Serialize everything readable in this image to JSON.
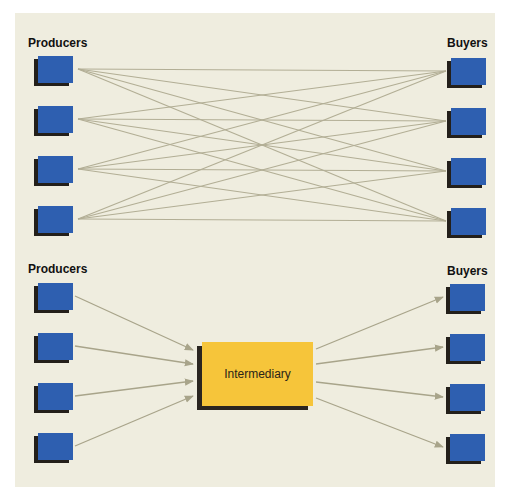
{
  "diagram": {
    "top": {
      "left_label": "Producers",
      "right_label": "Buyers",
      "producer_count": 4,
      "buyer_count": 4,
      "connection": "every producer connects directly to every buyer"
    },
    "bottom": {
      "left_label": "Producers",
      "right_label": "Buyers",
      "intermediary_label": "Intermediary",
      "producer_count": 4,
      "buyer_count": 4,
      "connection": "producers -> intermediary -> buyers (arrows)"
    },
    "colors": {
      "panel_bg": "#efeddf",
      "node_blue": "#2e5fb0",
      "intermediary_yellow": "#f6c53a",
      "line": "#a8a48a",
      "shadow": "#231f1a"
    }
  }
}
